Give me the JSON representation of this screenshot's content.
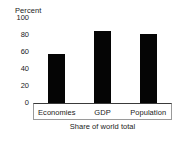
{
  "chart_data": {
    "type": "bar",
    "title": "",
    "unit_title": "Percent",
    "categories": [
      "Economies",
      "GDP",
      "Population"
    ],
    "values": [
      58,
      85,
      81
    ],
    "series": [
      {
        "name": "Share of world total",
        "values": [
          58,
          85,
          81
        ]
      }
    ],
    "xlabel": "Share of world total",
    "ylabel": "Percent",
    "ylim": [
      0,
      100
    ],
    "yticks": [
      0,
      20,
      40,
      60,
      80,
      100
    ],
    "ytick_labels": [
      "0",
      "20",
      "40",
      "60",
      "80",
      "100"
    ],
    "grid": false,
    "legend": "none",
    "bar_color": "#050505"
  },
  "caption": "Share of world total"
}
